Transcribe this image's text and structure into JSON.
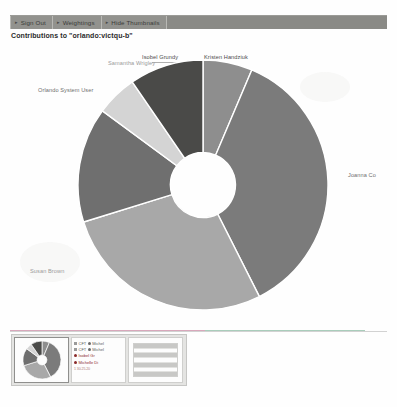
{
  "toolbar": {
    "buttons": [
      {
        "label": "Sign Out",
        "icon": "arrow-right-icon"
      },
      {
        "label": "Weightings",
        "icon": "arrow-right-icon"
      },
      {
        "label": "Hide Thumbnails",
        "icon": "arrow-right-icon"
      }
    ]
  },
  "page_title": "Contributions to \"orlando:victqu-b\"",
  "chart_data": {
    "type": "pie",
    "title": "Contributions to \"orlando:victqu-b\"",
    "donut": true,
    "hole_ratio": 0.26,
    "start_angle_deg": -90,
    "legend_position": "outside-labels",
    "categories": [
      "Kristen Handziuk",
      "Joanna Co",
      "Susan Brown",
      "Orlando System User",
      "Samantha Wrigley",
      "Isobel Grundy"
    ],
    "values": [
      6,
      34,
      26,
      14,
      5,
      9
    ],
    "colors": [
      "#8e8e8e",
      "#7b7b7b",
      "#a8a8a8",
      "#6f6f6f",
      "#d4d4d4",
      "#4a4a48"
    ],
    "labels": [
      {
        "text": "Kristen Handziuk",
        "x": 204,
        "y": 12,
        "tone": "dark"
      },
      {
        "text": "Isobel Grundy",
        "x": 142,
        "y": 12,
        "tone": "dark"
      },
      {
        "text": "Samantha Wrigley",
        "x": 108,
        "y": 18,
        "tone": "faint"
      },
      {
        "text": "Orlando System User",
        "x": 38,
        "y": 45,
        "tone": "mid"
      },
      {
        "text": "Joanna Co",
        "x": 348,
        "y": 130,
        "tone": "mid"
      },
      {
        "text": "Susan Brown",
        "x": 30,
        "y": 226,
        "tone": "faint"
      }
    ]
  },
  "thumbnails": {
    "items": [
      {
        "name": "pie-thumbnail",
        "kind": "pie",
        "selected": true
      },
      {
        "name": "legend-thumbnail",
        "kind": "legend",
        "selected": false
      },
      {
        "name": "table-thumbnail",
        "kind": "table",
        "selected": false
      }
    ],
    "legend_rows": [
      {
        "prefix": "CFT",
        "text": "Michel",
        "tone": "a"
      },
      {
        "prefix": "CFT",
        "text": "Michel",
        "tone": "a"
      },
      {
        "prefix": "",
        "text": "Isobel Gr",
        "tone": "b"
      },
      {
        "prefix": "",
        "text": "Michelle Di",
        "tone": "b"
      }
    ],
    "legend_stamp": "1 30.25.20",
    "table_row_count": 7
  }
}
